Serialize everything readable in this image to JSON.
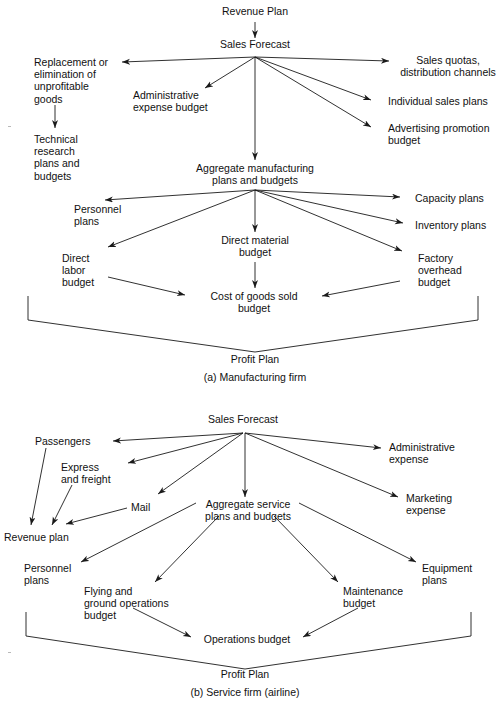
{
  "figure": {
    "panels": [
      {
        "id": "a",
        "caption": "(a) Manufacturing firm",
        "bottom_label": "Profit Plan",
        "nodes": {
          "revenue_plan": "Revenue Plan",
          "sales_forecast": "Sales Forecast",
          "replacement": "Replacement or\nelimination of\nunprofitable\ngoods",
          "technical_research": "Technical\nresearch\nplans and\nbudgets",
          "admin_expense": "Administrative\nexpense budget",
          "sales_quotas": "Sales quotas,\ndistribution channels",
          "individual_sales": "Individual sales plans",
          "advertising": "Advertising promotion\nbudget",
          "aggregate_mfg": "Aggregate manufacturing\nplans and budgets",
          "personnel_plans": "Personnel\nplans",
          "capacity_plans": "Capacity plans",
          "inventory_plans": "Inventory plans",
          "direct_material": "Direct material\nbudget",
          "direct_labor": "Direct\nlabor\nbudget",
          "factory_overhead": "Factory\noverhead\nbudget",
          "cogs": "Cost of goods sold\nbudget"
        }
      },
      {
        "id": "b",
        "caption": "(b) Service firm (airline)",
        "bottom_label": "Profit Plan",
        "nodes": {
          "sales_forecast": "Sales Forecast",
          "passengers": "Passengers",
          "express_freight": "Express\nand freight",
          "mail": "Mail",
          "revenue_plan": "Revenue plan",
          "administrative_expense": "Administrative\nexpense",
          "marketing_expense": "Marketing\nexpense",
          "aggregate_service": "Aggregate service\nplans and budgets",
          "personnel_plans": "Personnel\nplans",
          "equipment_plans": "Equipment\nplans",
          "flying_ground": "Flying and\nground operations\nbudget",
          "maintenance": "Maintenance\nbudget",
          "operations_budget": "Operations budget"
        }
      }
    ],
    "colors": {
      "line": "#1a1a1a",
      "text": "#111111",
      "background": "#ffffff"
    }
  }
}
